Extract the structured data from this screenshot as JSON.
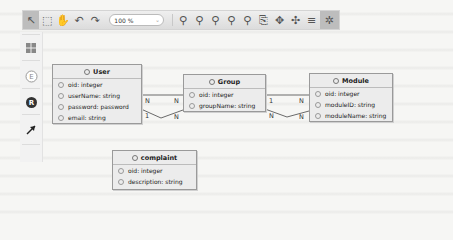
{
  "toolbar": {
    "zoom_value": "100 %",
    "buttons": [
      {
        "name": "select-tool",
        "glyph": "↖",
        "active": true
      },
      {
        "name": "marquee-tool",
        "glyph": "⬚",
        "active": false
      },
      {
        "name": "pan-tool",
        "glyph": "✋",
        "active": false
      },
      {
        "name": "undo",
        "glyph": "↶",
        "active": false
      },
      {
        "name": "redo",
        "glyph": "↷",
        "active": false
      }
    ],
    "zoom_buttons": [
      {
        "name": "zoom-in",
        "glyph": "🔍︎"
      },
      {
        "name": "zoom-out",
        "glyph": "🔍︎"
      },
      {
        "name": "zoom-fit",
        "glyph": "🔍︎"
      },
      {
        "name": "zoom-selection",
        "glyph": "🔍︎"
      },
      {
        "name": "zoom-actual",
        "glyph": "🔍︎"
      }
    ],
    "layout_buttons": [
      {
        "name": "export",
        "glyph": "⎘"
      },
      {
        "name": "layout-horizontal",
        "glyph": "✥"
      },
      {
        "name": "layout-vertical",
        "glyph": "✣"
      },
      {
        "name": "align",
        "glyph": "≡"
      },
      {
        "name": "auto-layout",
        "glyph": "✲",
        "active": true
      }
    ]
  },
  "palette": {
    "items": [
      {
        "name": "table-tool",
        "glyph": "▦"
      },
      {
        "name": "entity-tool",
        "glyph": "E"
      },
      {
        "name": "relationship-tool",
        "glyph": "R"
      },
      {
        "name": "connector-tool",
        "glyph": "↗"
      }
    ]
  },
  "entities": {
    "user": {
      "title": "User",
      "attrs": [
        "oid: integer",
        "userName: string",
        "password: password",
        "email: string"
      ]
    },
    "group": {
      "title": "Group",
      "attrs": [
        "oid: integer",
        "groupName: string"
      ]
    },
    "module": {
      "title": "Module",
      "attrs": [
        "oid: integer",
        "moduleID: string",
        "moduleName: string"
      ]
    },
    "complaint": {
      "title": "complaint",
      "attrs": [
        "oid: integer",
        "description: string"
      ]
    }
  },
  "relationships": {
    "user_group_top": {
      "from_card": "N",
      "to_card": "N"
    },
    "user_group_bottom": {
      "from_card": "1",
      "to_card": "N"
    },
    "group_module_top": {
      "from_card": "1",
      "to_card": "N"
    },
    "group_module_bottom": {
      "from_card": "N",
      "to_card": "N"
    }
  },
  "colors": {
    "toolbar_bg": "#e3e3e3",
    "entity_bg": "#ececec",
    "entity_border": "#9a9a9a",
    "line": "#6a6a6a"
  }
}
